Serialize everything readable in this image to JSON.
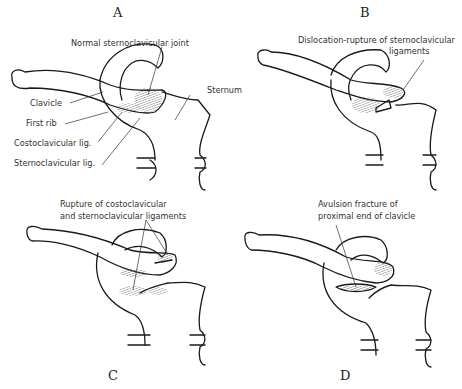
{
  "panels": [
    {
      "id": "A",
      "letter": "A",
      "labels": {
        "joint": "Normal sternoclavicular joint",
        "sternum": "Sternum",
        "clavicle": "Clavicle",
        "first_rib": "First rib",
        "costoclavicular": "Costoclavicular lig.",
        "sternoclavicular": "Sternoclavicular lig."
      }
    },
    {
      "id": "B",
      "letter": "B",
      "labels": {
        "line1": "Dislocation-rupture of sternoclavicular",
        "line2": "ligaments"
      }
    },
    {
      "id": "C",
      "letter": "C",
      "labels": {
        "line1": "Rupture of costoclavicular",
        "line2": "and sternoclavicular ligaments"
      }
    },
    {
      "id": "D",
      "letter": "D",
      "labels": {
        "line1": "Avulsion fracture of",
        "line2": "proximal end of clavicle"
      }
    }
  ]
}
